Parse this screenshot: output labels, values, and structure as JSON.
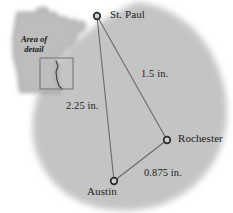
{
  "figure": {
    "type": "map-diagram",
    "colors": {
      "region_fill": "#c4c4c4",
      "state_fill": "#bdbdbd",
      "outline": "#5a5a5a",
      "line": "#6a6a6a",
      "text": "#1c1c1c",
      "background": "#ffffff"
    }
  },
  "inset": {
    "name": "minnesota-state-inset",
    "label_line1": "Area of",
    "label_line2": "detail",
    "detail_rect": {
      "x": 40,
      "y": 58,
      "width": 33,
      "height": 31
    }
  },
  "cities": [
    {
      "id": "st-paul",
      "label": "St. Paul",
      "x": 97,
      "y": 16
    },
    {
      "id": "rochester",
      "label": "Rochester",
      "x": 167,
      "y": 140
    },
    {
      "id": "austin",
      "label": "Austin",
      "x": 114,
      "y": 181
    }
  ],
  "distances": [
    {
      "id": "st-paul-rochester",
      "label": "1.5 in.",
      "value": 1.5,
      "unit": "in.",
      "from": "st-paul",
      "to": "rochester"
    },
    {
      "id": "st-paul-austin",
      "label": "2.25 in.",
      "value": 2.25,
      "unit": "in.",
      "from": "st-paul",
      "to": "austin"
    },
    {
      "id": "austin-rochester",
      "label": "0.875 in.",
      "value": 0.875,
      "unit": "in.",
      "from": "austin",
      "to": "rochester"
    }
  ]
}
